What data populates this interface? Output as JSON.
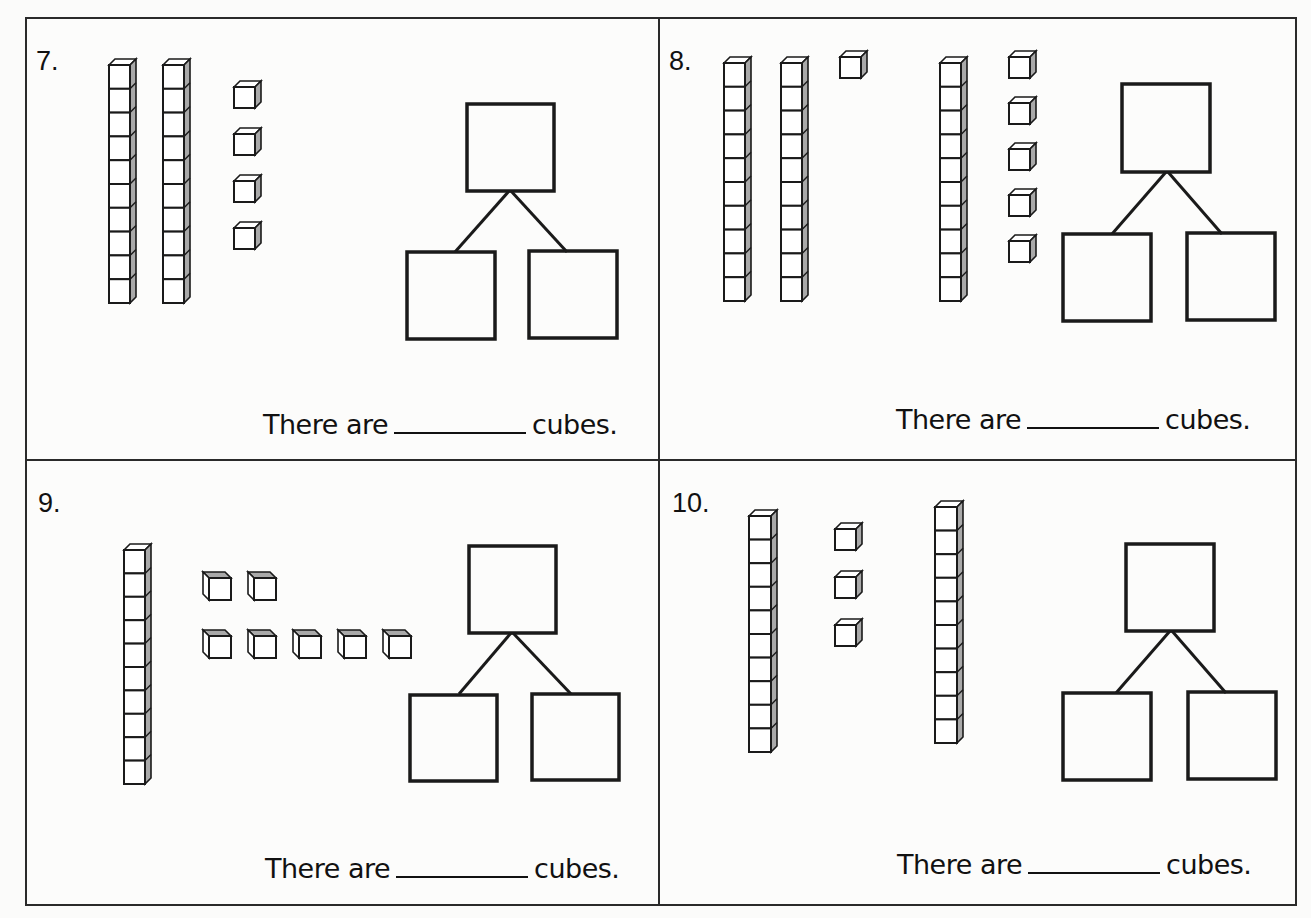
{
  "worksheet": {
    "sentence_prefix": "There are",
    "sentence_suffix": "cubes.",
    "problems": [
      {
        "number_label": "7.",
        "tens_rods": 2,
        "ones_cubes": 4,
        "answer_blank": "",
        "number_bond": {
          "whole": "",
          "part_left": "",
          "part_right": ""
        }
      },
      {
        "number_label": "8.",
        "tens_rods": 3,
        "ones_cubes": 6,
        "answer_blank": "",
        "number_bond": {
          "whole": "",
          "part_left": "",
          "part_right": ""
        }
      },
      {
        "number_label": "9.",
        "tens_rods": 1,
        "ones_cubes": 7,
        "answer_blank": "",
        "number_bond": {
          "whole": "",
          "part_left": "",
          "part_right": ""
        }
      },
      {
        "number_label": "10.",
        "tens_rods": 2,
        "ones_cubes": 3,
        "answer_blank": "",
        "number_bond": {
          "whole": "",
          "part_left": "",
          "part_right": ""
        }
      }
    ]
  },
  "colors": {
    "line": "#1a1a1a",
    "cube_shade": "#a9a9a9",
    "paper": "#fcfcfb"
  }
}
